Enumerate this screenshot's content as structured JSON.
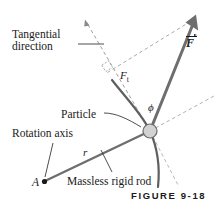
{
  "figure": {
    "caption": "FIGURE 9-18",
    "colors": {
      "force_vector": "#6e6e6e",
      "rod": "#6e6e6e",
      "arc": "#5a5a5a",
      "dashed": "#9a9a9a",
      "particle_fill": "#cfcfcf",
      "particle_stroke": "#6a6a6a",
      "text": "#1a1a1a"
    }
  },
  "labels": {
    "tangential_line1": "Tangential",
    "tangential_line2": "direction",
    "particle": "Particle",
    "rotation_axis": "Rotation axis",
    "massless_rigid_rod": "Massless rigid rod",
    "point_a": "A",
    "radius": "r",
    "force": "F",
    "force_tangential": "F",
    "force_tangential_sub": "t",
    "phi": "ϕ"
  },
  "geometry": {
    "rotation_axis_point": {
      "x": 44,
      "y": 182
    },
    "particle_point": {
      "x": 150,
      "y": 131
    },
    "force_tip": {
      "x": 196,
      "y": 16
    },
    "tangential_tip": {
      "x": 85,
      "y": 21
    }
  }
}
